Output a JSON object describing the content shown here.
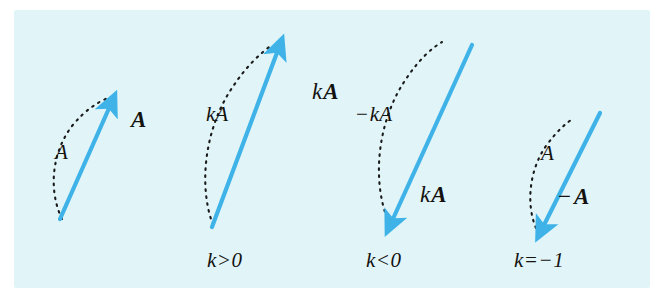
{
  "figure": {
    "background_color": "#e1f5f9",
    "page_color": "#ffffff",
    "vector_color": "#3fb3e8",
    "dash_color": "#1a1a1a",
    "text_color": "#14120f",
    "panels": [
      {
        "id": "panel-a",
        "caption": "",
        "magnitude_label": "A",
        "vector_label": "A",
        "description": "Original vector A pointing up and to the right"
      },
      {
        "id": "panel-k-positive",
        "caption": "k>0",
        "magnitude_label": "kA",
        "vector_label_k": "k",
        "vector_label_A": "A",
        "description": "Vector kA, same direction, longer"
      },
      {
        "id": "panel-k-negative",
        "caption": "k<0",
        "magnitude_label_minus": "−",
        "magnitude_label": "kA",
        "vector_label_k": "k",
        "vector_label_A": "A",
        "description": "Vector kA reversed, pointing down and to the left"
      },
      {
        "id": "panel-k-equals-minus-one",
        "caption": "k=−1",
        "magnitude_label": "A",
        "vector_label_minus": "−",
        "vector_label_A": "A",
        "description": "Vector negative A, same magnitude, opposite direction"
      }
    ],
    "labels": {
      "panel1_magnitude": "A",
      "panel1_vector": "A",
      "panel2_magnitude": "kA",
      "panel2_vector_k": "k",
      "panel2_vector_A": "A",
      "panel2_caption": "k>0",
      "panel3_magnitude_minus": "−",
      "panel3_magnitude": "kA",
      "panel3_vector_k": "k",
      "panel3_vector_A": "A",
      "panel3_caption": "k<0",
      "panel4_magnitude": "A",
      "panel4_vector_minus": "−",
      "panel4_vector_A": "A",
      "panel4_caption": "k=−1"
    }
  }
}
